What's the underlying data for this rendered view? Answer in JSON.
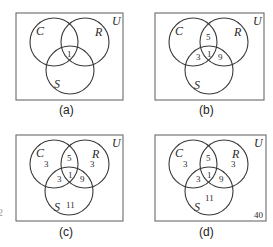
{
  "figure": {
    "sets": {
      "c": "C",
      "r": "R",
      "s": "S",
      "universe": "U"
    },
    "panels": [
      {
        "caption": "(a)",
        "regions": {
          "c_only": "",
          "r_only": "",
          "s_only": "",
          "c_r": "",
          "c_s": "",
          "r_s": "",
          "c_r_s": "1",
          "outside": ""
        }
      },
      {
        "caption": "(b)",
        "regions": {
          "c_only": "",
          "r_only": "",
          "s_only": "",
          "c_r": "5",
          "c_s": "3",
          "r_s": "9",
          "c_r_s": "1",
          "outside": ""
        }
      },
      {
        "caption": "(c)",
        "regions": {
          "c_only": "3",
          "r_only": "3",
          "s_only": "11",
          "c_r": "5",
          "c_s": "3",
          "r_s": "9",
          "c_r_s": "1",
          "outside": ""
        }
      },
      {
        "caption": "(d)",
        "regions": {
          "c_only": "3",
          "r_only": "3",
          "s_only": "11",
          "c_r": "5",
          "c_s": "3",
          "r_s": "9",
          "c_r_s": "1",
          "outside": "40"
        }
      }
    ],
    "edge_mark": "2"
  },
  "colors": {
    "box": "#6a6a6a",
    "circle": "#3a3a3a",
    "text": "#2a2a2a"
  }
}
